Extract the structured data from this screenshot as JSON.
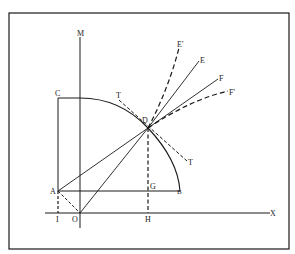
{
  "diagram": {
    "labels": {
      "M": "M",
      "C": "C",
      "T_upper": "T",
      "D": "D",
      "E_prime": "E'",
      "E": "E",
      "F": "F",
      "F_prime": "F'",
      "T_lower": "T",
      "A": "A",
      "G": "G",
      "B": "B",
      "I": "I",
      "O": "O",
      "H": "H",
      "X": "X"
    },
    "colors": {
      "stroke": "#1a1a1a",
      "background": "#ffffff"
    }
  }
}
